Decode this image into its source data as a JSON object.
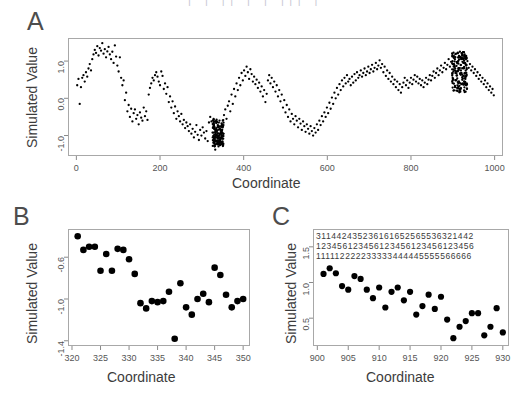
{
  "figure": {
    "background_color": "#ffffff",
    "point_color": "#000000",
    "frame_color": "#a8a8a8",
    "text_color": "#3c3c3c",
    "width": 519,
    "height": 398,
    "top_clipped_text": "|  |  ||  |  |  |||  |"
  },
  "panels": {
    "a": {
      "letter": "A"
    },
    "b": {
      "letter": "B"
    },
    "c": {
      "letter": "C"
    }
  },
  "chart_data": [
    {
      "id": "panel-a",
      "panel": "A",
      "type": "scatter",
      "title": "",
      "xlabel": "Coordinate",
      "ylabel": "Simulated Value",
      "xlim": [
        -20,
        1020
      ],
      "ylim": [
        -1.55,
        1.62
      ],
      "xticks": [
        0,
        200,
        400,
        600,
        800,
        1000
      ],
      "yticks": [
        -1.0,
        0.0,
        1.0
      ],
      "xticklabels": [
        "0",
        "200",
        "400",
        "600",
        "800",
        "1000"
      ],
      "yticklabels": [
        "-1.0",
        "0.0",
        "1.0"
      ],
      "grid": false,
      "legend": "none",
      "marker": "point",
      "n_points": 620,
      "note": "Dense simulated signal with wave-like trend; dark over-plotted clusters near x=330-350 (y about -1.0 to -1.3) and x=900-930 (y about 0.2 to 1.2).",
      "x": [
        2,
        5,
        8,
        11,
        14,
        17,
        20,
        23,
        26,
        29,
        32,
        35,
        38,
        41,
        44,
        47,
        50,
        53,
        56,
        59,
        62,
        65,
        68,
        71,
        74,
        77,
        80,
        83,
        86,
        89,
        92,
        95,
        98,
        101,
        104,
        107,
        110,
        113,
        116,
        119,
        122,
        125,
        128,
        131,
        134,
        137,
        140,
        143,
        146,
        149,
        152,
        155,
        158,
        161,
        164,
        167,
        170,
        173,
        176,
        179,
        182,
        185,
        188,
        191,
        194,
        197,
        200,
        203,
        206,
        209,
        212,
        215,
        218,
        221,
        224,
        227,
        230,
        233,
        236,
        239,
        242,
        245,
        248,
        251,
        254,
        257,
        260,
        263,
        266,
        269,
        272,
        275,
        278,
        281,
        284,
        287,
        290,
        293,
        296,
        299,
        302,
        305,
        308,
        311,
        314,
        317,
        320,
        323,
        326,
        329,
        332,
        335,
        338,
        341,
        344,
        347,
        350,
        353,
        356,
        359,
        362,
        365,
        368,
        371,
        374,
        377,
        380,
        383,
        386,
        389,
        392,
        395,
        398,
        401,
        404,
        407,
        410,
        413,
        416,
        419,
        422,
        425,
        428,
        431,
        434,
        437,
        440,
        443,
        446,
        449,
        452,
        455,
        458,
        461,
        464,
        467,
        470,
        473,
        476,
        479,
        482,
        485,
        488,
        491,
        494,
        497,
        500,
        503,
        506,
        509,
        512,
        515,
        518,
        521,
        524,
        527,
        530,
        533,
        536,
        539,
        542,
        545,
        548,
        551,
        554,
        557,
        560,
        563,
        566,
        569,
        572,
        575,
        578,
        581,
        584,
        587,
        590,
        593,
        596,
        599,
        602,
        605,
        608,
        611,
        614,
        617,
        620,
        623,
        626,
        629,
        632,
        635,
        638,
        641,
        644,
        647,
        650,
        653,
        656,
        659,
        662,
        665,
        668,
        671,
        674,
        677,
        680,
        683,
        686,
        689,
        692,
        695,
        698,
        701,
        704,
        707,
        710,
        713,
        716,
        719,
        722,
        725,
        728,
        731,
        734,
        737,
        740,
        743,
        746,
        749,
        752,
        755,
        758,
        761,
        764,
        767,
        770,
        773,
        776,
        779,
        782,
        785,
        788,
        791,
        794,
        797,
        800,
        803,
        806,
        809,
        812,
        815,
        818,
        821,
        824,
        827,
        830,
        833,
        836,
        839,
        842,
        845,
        848,
        851,
        854,
        857,
        860,
        863,
        866,
        869,
        872,
        875,
        878,
        881,
        884,
        887,
        890,
        893,
        896,
        899,
        902,
        905,
        908,
        911,
        914,
        917,
        920,
        923,
        926,
        929,
        932,
        935,
        938,
        941,
        944,
        947,
        950,
        953,
        956,
        959,
        962,
        965,
        968,
        971,
        974,
        977,
        980,
        983,
        986,
        989,
        992,
        995,
        998
      ],
      "y": [
        0.35,
        0.52,
        -0.15,
        0.3,
        0.55,
        0.62,
        0.45,
        0.7,
        0.58,
        0.8,
        0.92,
        0.75,
        1.05,
        1.18,
        1.3,
        1.22,
        1.4,
        1.15,
        1.35,
        1.28,
        1.48,
        1.2,
        1.32,
        1.1,
        1.26,
        1.38,
        1.18,
        1.05,
        1.25,
        0.95,
        1.42,
        1.12,
        0.88,
        0.72,
        1.1,
        0.55,
        0.35,
        0.48,
        -0.05,
        0.15,
        -0.35,
        -0.18,
        -0.5,
        -0.28,
        -0.62,
        -0.4,
        -0.3,
        -0.55,
        -0.45,
        -0.7,
        -0.38,
        -0.52,
        -0.6,
        -0.25,
        -0.48,
        -0.35,
        -0.58,
        0.1,
        0.28,
        0.4,
        0.55,
        0.48,
        0.62,
        0.7,
        0.58,
        0.45,
        0.35,
        0.72,
        0.6,
        0.25,
        0.4,
        0.12,
        0.3,
        -0.1,
        0.05,
        -0.25,
        -0.08,
        -0.4,
        -0.22,
        -0.55,
        -0.35,
        -0.48,
        -0.62,
        -0.42,
        -0.7,
        -0.58,
        -0.8,
        -0.65,
        -0.75,
        -0.88,
        -0.7,
        -0.95,
        -0.82,
        -1.05,
        -0.9,
        -0.72,
        -0.98,
        -1.12,
        -0.85,
        -1.0,
        -0.78,
        -0.92,
        -1.08,
        -0.88,
        -1.15,
        -0.65,
        -0.5,
        -0.62,
        -1.05,
        -1.1,
        -1.38,
        -1.15,
        -1.02,
        -0.95,
        -1.2,
        -0.85,
        -0.6,
        -0.45,
        -0.3,
        -0.55,
        -0.2,
        -0.08,
        -0.35,
        0.1,
        -0.15,
        0.25,
        0.05,
        0.4,
        0.22,
        0.55,
        0.35,
        0.68,
        0.48,
        0.75,
        0.6,
        0.85,
        0.7,
        0.52,
        0.78,
        0.65,
        0.45,
        0.58,
        0.38,
        0.5,
        0.28,
        0.42,
        0.18,
        0.32,
        0.05,
        0.22,
        -0.1,
        0.12,
        0.48,
        0.62,
        0.4,
        0.55,
        0.3,
        0.45,
        0.18,
        0.35,
        0.05,
        0.22,
        -0.08,
        0.1,
        -0.25,
        -0.05,
        -0.38,
        -0.18,
        -0.5,
        -0.3,
        -0.62,
        -0.42,
        -0.55,
        -0.7,
        -0.48,
        -0.6,
        -0.78,
        -0.55,
        -0.68,
        -0.85,
        -0.62,
        -0.75,
        -0.9,
        -0.7,
        -0.82,
        -0.95,
        -0.75,
        -0.88,
        -1.0,
        -0.8,
        -0.92,
        -0.7,
        -0.85,
        -0.6,
        -0.72,
        -0.48,
        -0.62,
        -0.38,
        -0.5,
        -0.25,
        -0.4,
        -0.12,
        -0.28,
        0.02,
        -0.15,
        0.15,
        0.0,
        0.28,
        0.1,
        0.38,
        0.22,
        0.48,
        0.32,
        0.55,
        0.4,
        0.62,
        0.45,
        0.52,
        0.35,
        0.58,
        0.42,
        0.65,
        0.48,
        0.7,
        0.55,
        0.62,
        0.75,
        0.58,
        0.68,
        0.8,
        0.62,
        0.72,
        0.85,
        0.68,
        0.78,
        0.9,
        0.72,
        0.82,
        0.95,
        0.78,
        0.88,
        1.02,
        0.82,
        0.92,
        0.7,
        0.85,
        0.6,
        0.75,
        0.52,
        0.68,
        0.45,
        0.58,
        0.38,
        0.5,
        0.3,
        0.45,
        0.22,
        0.38,
        0.15,
        0.3,
        0.42,
        0.55,
        0.35,
        0.48,
        0.28,
        0.42,
        0.55,
        0.38,
        0.5,
        0.62,
        0.45,
        0.58,
        0.4,
        0.52,
        0.35,
        0.48,
        0.3,
        0.42,
        0.55,
        0.38,
        0.5,
        0.62,
        0.48,
        0.6,
        0.72,
        0.55,
        0.68,
        0.8,
        0.62,
        0.75,
        0.88,
        0.7,
        0.82,
        0.95,
        0.78,
        0.9,
        1.05,
        0.85,
        0.98,
        1.12,
        0.92,
        1.05,
        1.2,
        0.98,
        1.1,
        1.25,
        1.05,
        1.15,
        0.95,
        1.08,
        0.88,
        1.0,
        0.82,
        0.92,
        0.75,
        0.85,
        0.68,
        0.78,
        0.6,
        0.7,
        0.52,
        0.62,
        0.45,
        0.55,
        0.38,
        0.48,
        0.3,
        0.4,
        0.22,
        0.32,
        0.15,
        0.25,
        0.08,
        0.18,
        0.02,
        0.12,
        -0.05,
        0.05,
        0.18,
        0.3,
        0.12,
        0.22,
        0.05,
        0.15,
        0.28,
        0.08,
        0.18,
        0.32,
        0.1,
        0.2,
        0.02,
        0.12,
        -0.08,
        0.05,
        0.15,
        -0.02,
        0.08,
        0.2,
        0.0,
        0.1,
        -0.12,
        0.02
      ]
    },
    {
      "id": "panel-b",
      "panel": "B",
      "type": "scatter",
      "title": "",
      "xlabel": "Coordinate",
      "ylabel": "Simulated Value",
      "xlim": [
        319.3,
        351.2
      ],
      "ylim": [
        -1.45,
        -0.33
      ],
      "xticks": [
        320,
        325,
        330,
        335,
        340,
        345,
        350
      ],
      "yticks": [
        -1.4,
        -1.0,
        -0.6
      ],
      "xticklabels": [
        "320",
        "325",
        "330",
        "335",
        "340",
        "345",
        "350"
      ],
      "yticklabels": [
        "-1.4",
        "-1.0",
        "-0.6"
      ],
      "grid": false,
      "legend": "none",
      "marker": "filled-circle",
      "x": [
        321,
        322,
        323,
        324,
        325,
        326,
        327,
        328,
        329,
        330,
        331,
        332,
        333,
        334,
        335,
        336,
        337,
        338,
        339,
        340,
        341,
        342,
        343,
        344,
        345,
        346,
        347,
        348,
        349,
        350
      ],
      "y": [
        -0.4,
        -0.53,
        -0.5,
        -0.5,
        -0.73,
        -0.57,
        -0.73,
        -0.52,
        -0.53,
        -0.62,
        -0.76,
        -1.04,
        -1.09,
        -1.02,
        -1.03,
        -1.02,
        -0.93,
        -1.38,
        -0.85,
        -1.08,
        -1.15,
        -1.0,
        -0.95,
        -1.03,
        -0.7,
        -0.77,
        -0.96,
        -1.08,
        -1.02,
        -1.0
      ]
    },
    {
      "id": "panel-c",
      "panel": "C",
      "type": "scatter",
      "title": "",
      "xlabel": "Coordinate",
      "ylabel": "Simulated Value",
      "xlim": [
        899.3,
        931.0
      ],
      "ylim": [
        0.11,
        1.75
      ],
      "xticks": [
        900,
        905,
        910,
        915,
        920,
        925,
        930
      ],
      "yticks": [
        0.5,
        1.0,
        1.5
      ],
      "xticklabels": [
        "900",
        "905",
        "910",
        "915",
        "920",
        "925",
        "930"
      ],
      "yticklabels": [
        "0.5",
        "1.0",
        "1.5"
      ],
      "grid": false,
      "legend": "none",
      "marker": "filled-circle",
      "x": [
        901,
        902,
        903,
        904,
        905,
        906,
        907,
        908,
        909,
        910,
        911,
        912,
        913,
        914,
        915,
        916,
        917,
        918,
        919,
        920,
        921,
        922,
        923,
        924,
        925,
        926,
        927,
        928,
        929,
        930
      ],
      "y": [
        1.12,
        1.2,
        1.13,
        0.95,
        0.9,
        1.09,
        1.05,
        0.9,
        0.78,
        0.93,
        0.65,
        0.87,
        0.93,
        0.75,
        0.87,
        0.55,
        0.67,
        0.83,
        0.63,
        0.8,
        0.48,
        0.22,
        0.38,
        0.46,
        0.57,
        0.57,
        0.26,
        0.38,
        0.64,
        0.3
      ],
      "annotation_rows": [
        "311442435236161652565536321442",
        "123456123456123456123456123456",
        "111112222233333444445555566666"
      ]
    }
  ]
}
